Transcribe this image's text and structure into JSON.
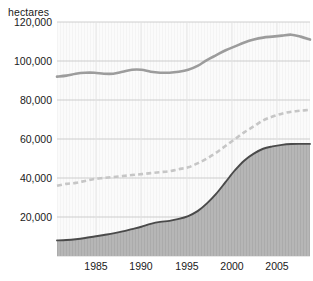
{
  "chart_data": {
    "type": "area",
    "title": "",
    "subtitle": "",
    "xlabel": "",
    "ylabel": "hectares",
    "axis_unit_label": "hectares",
    "xlim": [
      1981,
      2008
    ],
    "ylim": [
      0,
      120000
    ],
    "ytick_labels": [
      "120,000",
      "100,000",
      "80,000",
      "60,000",
      "40,000",
      "20,000"
    ],
    "ytick_values": [
      120000,
      100000,
      80000,
      60000,
      40000,
      20000
    ],
    "xtick_labels": [
      "1985",
      "1990",
      "1995",
      "2000",
      "2005"
    ],
    "xtick_values": [
      1985,
      1990,
      1995,
      2000,
      2005
    ],
    "grid": true,
    "legend_position": "inline-annotations",
    "x": [
      1981,
      1982,
      1983,
      1984,
      1985,
      1986,
      1987,
      1988,
      1989,
      1990,
      1991,
      1992,
      1993,
      1994,
      1995,
      1996,
      1997,
      1998,
      1999,
      2000,
      2001,
      2002,
      2003,
      2004,
      2005,
      2006,
      2007,
      2008
    ],
    "series": [
      {
        "name": "Total grapevines",
        "style": "solid-line",
        "color": "#9a9a9a",
        "values": [
          92000,
          92500,
          93500,
          94000,
          94000,
          93500,
          93500,
          94500,
          95500,
          95500,
          94500,
          94000,
          94000,
          94500,
          95500,
          97500,
          100500,
          103000,
          105500,
          107500,
          109500,
          111000,
          112000,
          112500,
          113000,
          113500,
          112500,
          111000
        ]
      },
      {
        "name": "Quality + Chenin Blanc",
        "style": "dashed-line",
        "color": "#c4c4c4",
        "values": [
          36000,
          37000,
          37500,
          38500,
          39500,
          40000,
          40500,
          41000,
          41500,
          42000,
          42500,
          43000,
          43500,
          44500,
          45500,
          47500,
          50000,
          53000,
          56500,
          60000,
          63500,
          66500,
          69500,
          71500,
          73000,
          74000,
          74500,
          75000
        ]
      },
      {
        "name": "Quality Varieties",
        "style": "filled-area",
        "color": "#4a4a4a",
        "fill": "#b4b4b4",
        "values": [
          8000,
          8200,
          8600,
          9200,
          10000,
          10800,
          11600,
          12600,
          13800,
          15000,
          16500,
          17500,
          18000,
          19000,
          20500,
          23000,
          27000,
          32000,
          38000,
          44000,
          49000,
          52500,
          55000,
          56200,
          57000,
          57400,
          57500,
          57500
        ]
      }
    ],
    "annotations": [
      {
        "text": "Total grapevines",
        "series": "Total grapevines"
      },
      {
        "text": "Quality + Chenin Blanc",
        "series": "Quality + Chenin Blanc"
      },
      {
        "text": "Quality Varieties",
        "series": "Quality Varieties"
      }
    ]
  },
  "colors": {
    "background": "#ffffff",
    "plot_background": "#fbfbfb",
    "gridline": "#bfbfbf",
    "total_line": "#9a9a9a",
    "dashed_line": "#c4c4c4",
    "area_line": "#4a4a4a",
    "area_fill": "#b4b4b4",
    "text": "#1a1a1a"
  },
  "axis": {
    "unit": "hectares",
    "yticks": [
      {
        "label": "120,000"
      },
      {
        "label": "100,000"
      },
      {
        "label": "80,000"
      },
      {
        "label": "60,000"
      },
      {
        "label": "40,000"
      },
      {
        "label": "20,000"
      }
    ],
    "xticks": [
      {
        "label": "1985"
      },
      {
        "label": "1990"
      },
      {
        "label": "1995"
      },
      {
        "label": "2000"
      },
      {
        "label": "2005"
      }
    ]
  },
  "labels": {
    "total": "Total grapevines",
    "quality_chenin": "Quality + Chenin Blanc",
    "quality_varieties": "Quality Varieties"
  }
}
